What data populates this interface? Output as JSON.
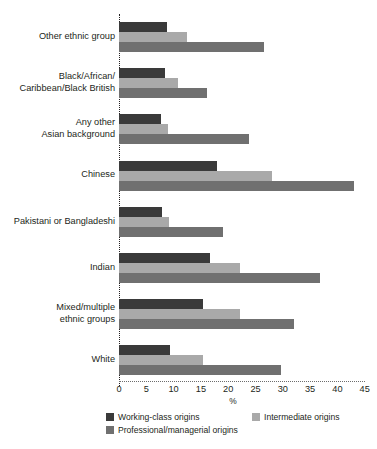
{
  "chart_data": {
    "type": "bar",
    "orientation": "horizontal",
    "title": "",
    "subtitle": "",
    "xlabel": "%",
    "ylabel": "",
    "xlim": [
      0,
      45
    ],
    "xticks": [
      0,
      5,
      10,
      15,
      20,
      25,
      30,
      35,
      40,
      45
    ],
    "xtick_labels": [
      "0",
      "5",
      "10",
      "15",
      "20",
      "25",
      "30",
      "35",
      "40",
      "45"
    ],
    "grid": false,
    "legend_position": "bottom",
    "categories": [
      "Other ethnic group",
      "Black/African/\nCaribbean/Black British",
      "Any other\nAsian background",
      "Chinese",
      "Pakistani or Bangladeshi",
      "Indian",
      "Mixed/multiple\nethnic groups",
      "White"
    ],
    "series": [
      {
        "name": "Working-class origins",
        "color": "#3a3a3a",
        "values": [
          8.8,
          8.5,
          7.7,
          18.0,
          7.9,
          16.7,
          15.3,
          9.4
        ]
      },
      {
        "name": "Intermediate origins",
        "color": "#a9a9a9",
        "values": [
          12.5,
          10.8,
          8.9,
          28.0,
          9.2,
          22.1,
          22.1,
          15.3
        ]
      },
      {
        "name": "Professional/managerial origins",
        "color": "#707070",
        "values": [
          26.5,
          16.2,
          23.9,
          43.0,
          19.1,
          36.9,
          32.0,
          29.6
        ]
      }
    ]
  },
  "legend": {
    "items": [
      {
        "label": "Working-class origins",
        "color": "#3a3a3a"
      },
      {
        "label": "Intermediate origins",
        "color": "#a9a9a9"
      },
      {
        "label": "Professional/managerial origins",
        "color": "#707070"
      }
    ]
  },
  "axis": {
    "x_title": "%"
  }
}
